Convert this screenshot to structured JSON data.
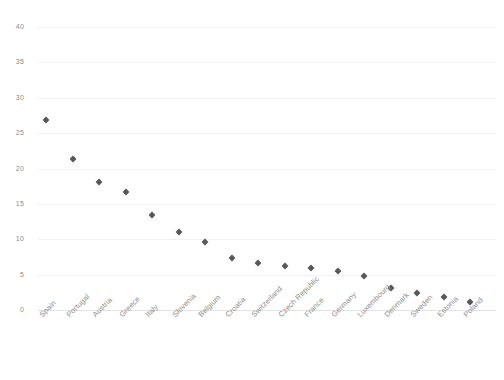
{
  "chart_data": {
    "type": "scatter",
    "title": "",
    "subtitle": "",
    "xlabel": "",
    "ylabel": "",
    "categories": [
      "Spain",
      "Portugal",
      "Austria",
      "Greece",
      "Italy",
      "Slovenia",
      "Belgium",
      "Croatia",
      "Switzerland",
      "Czech Republic",
      "France",
      "Germany",
      "Luxembourg",
      "Denmark",
      "Sweden",
      "Estonia",
      "Poland"
    ],
    "values": [
      26.8,
      21.4,
      18.1,
      16.7,
      13.4,
      11.0,
      9.6,
      7.3,
      6.7,
      6.2,
      5.9,
      5.5,
      4.8,
      3.1,
      2.4,
      1.9,
      1.1
    ],
    "ylim": [
      0,
      40
    ],
    "yticks": [
      0,
      5,
      10,
      15,
      20,
      25,
      30,
      35,
      40
    ],
    "ytick_labels": [
      "0",
      "5",
      "10",
      "15",
      "20",
      "25",
      "30",
      "35",
      "40"
    ],
    "grid": true,
    "legend": false,
    "legend_position": "none",
    "marker": "diamond",
    "marker_color": "#595959",
    "gridline_color": "#f2f2f2",
    "axis_color": "#e2e2e2",
    "background_color": "#ffffff",
    "tick_label_color": "#8c8c8c"
  }
}
